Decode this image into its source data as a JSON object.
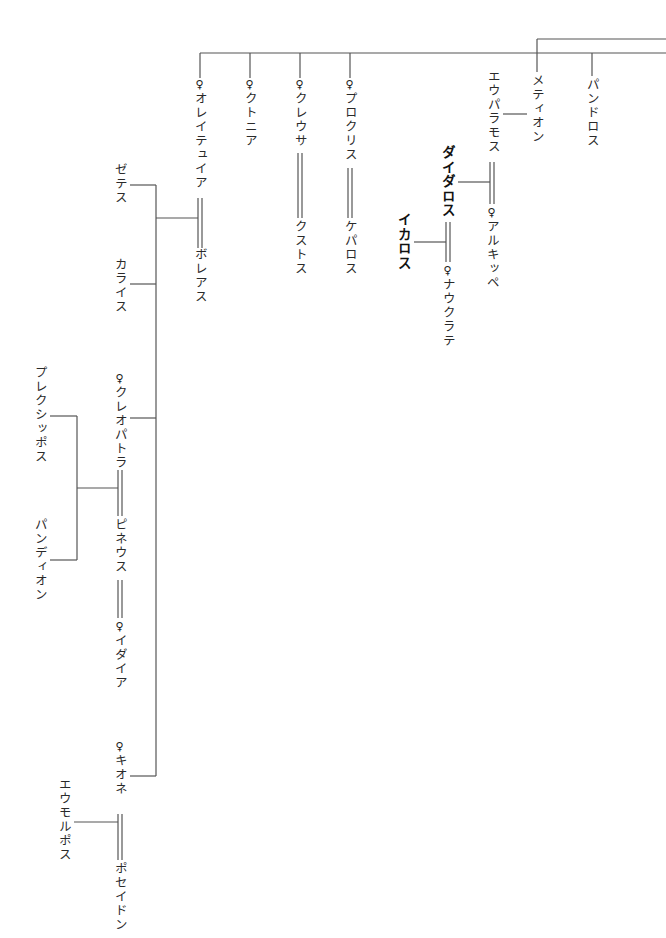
{
  "diagram": {
    "type": "genealogy-tree",
    "female_marker": "♀",
    "people": {
      "oreithyia": {
        "label": "オレイテュイア",
        "female": true
      },
      "chthonia": {
        "label": "クトニア",
        "female": true
      },
      "creusa": {
        "label": "クレウサ",
        "female": true
      },
      "procris": {
        "label": "プロクリス",
        "female": true
      },
      "metion": {
        "label": "メティオン",
        "female": false
      },
      "pandoros": {
        "label": "パンドロス",
        "female": false
      },
      "eupalamos": {
        "label": "エウパラモス",
        "female": false
      },
      "daidalos": {
        "label": "ダイダロス",
        "female": false,
        "emphasis": true
      },
      "alcippe": {
        "label": "アルキッペ",
        "female": true
      },
      "ikaros": {
        "label": "イカロス",
        "female": false,
        "emphasis": true
      },
      "naukrate": {
        "label": "ナウクラテ",
        "female": true
      },
      "xouthos": {
        "label": "クストス",
        "female": false
      },
      "kephalos": {
        "label": "ケパロス",
        "female": false
      },
      "boreas": {
        "label": "ボレアス",
        "female": false
      },
      "zetes": {
        "label": "ゼテス",
        "female": false
      },
      "kalais": {
        "label": "カライス",
        "female": false
      },
      "kleopatra": {
        "label": "クレオパトラ",
        "female": true
      },
      "phineus": {
        "label": "ピネウス",
        "female": false
      },
      "idaia": {
        "label": "イダイア",
        "female": true
      },
      "plexippos": {
        "label": "プレクシッポス",
        "female": false
      },
      "pandion": {
        "label": "パンディオン",
        "female": false
      },
      "chione": {
        "label": "キオネ",
        "female": true
      },
      "poseidon": {
        "label": "ポセイドン",
        "female": false
      },
      "eumolpos": {
        "label": "エウモルポス",
        "female": false
      }
    },
    "marriages": [
      [
        "oreithyia",
        "boreas"
      ],
      [
        "creusa",
        "xouthos"
      ],
      [
        "procris",
        "kephalos"
      ],
      [
        "daidalos",
        "alcippe"
      ],
      [
        "ikaros",
        "naukrate"
      ],
      [
        "kleopatra",
        "phineus"
      ],
      [
        "phineus",
        "idaia"
      ],
      [
        "chione",
        "poseidon"
      ]
    ],
    "children": {
      "oreithyia+boreas": [
        "zetes",
        "kalais",
        "kleopatra",
        "chione"
      ],
      "metion": [
        "eupalamos"
      ],
      "eupalamos": [
        "daidalos"
      ],
      "daidalos": [
        "ikaros"
      ],
      "kleopatra+phineus": [
        "plexippos",
        "pandion"
      ],
      "chione+poseidon": [
        "eumolpos"
      ]
    }
  }
}
